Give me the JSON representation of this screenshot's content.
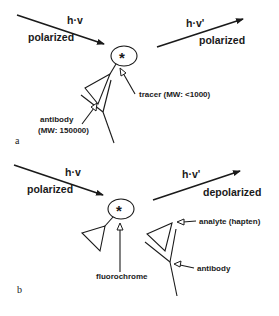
{
  "panels": [
    {
      "id": "a",
      "panel_label": "a",
      "incident_light": {
        "symbol": "h·v",
        "state": "polarized"
      },
      "emitted_light": {
        "symbol": "h·v'",
        "state": "polarized"
      },
      "labels": {
        "tracer": "tracer (MW: <1000)",
        "antibody_line1": "antibody",
        "antibody_line2": "(MW: 150000)"
      },
      "star": "*"
    },
    {
      "id": "b",
      "panel_label": "b",
      "incident_light": {
        "symbol": "h·v",
        "state": "polarized"
      },
      "emitted_light": {
        "symbol": "h·v'",
        "state": "depolarized"
      },
      "labels": {
        "fluorochrome": "fluorochrome",
        "analyte": "analyte (hapten)",
        "antibody": "antibody"
      },
      "star": "*"
    }
  ]
}
